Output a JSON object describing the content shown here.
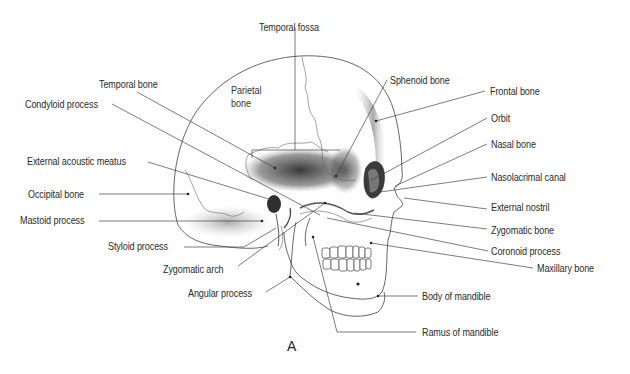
{
  "figure": {
    "caption": "A"
  },
  "inner_labels": {
    "parietal": "Parietal\nbone",
    "parietal_line1": "Parietal",
    "parietal_line2": "bone"
  },
  "labels_top": {
    "temporal_fossa": "Temporal fossa"
  },
  "labels_left": [
    {
      "id": "temporal-bone",
      "text": "Temporal bone"
    },
    {
      "id": "condyloid-process",
      "text": "Condyloid process"
    },
    {
      "id": "external-acoustic-meatus",
      "text": "External acoustic meatus"
    },
    {
      "id": "occipital-bone",
      "text": "Occipital bone"
    },
    {
      "id": "mastoid-process",
      "text": "Mastoid process"
    },
    {
      "id": "styloid-process",
      "text": "Styloid process"
    },
    {
      "id": "zygomatic-arch",
      "text": "Zygomatic arch"
    },
    {
      "id": "angular-process",
      "text": "Angular process"
    }
  ],
  "labels_right": [
    {
      "id": "sphenoid-bone",
      "text": "Sphenoid bone"
    },
    {
      "id": "frontal-bone",
      "text": "Frontal bone"
    },
    {
      "id": "orbit",
      "text": "Orbit"
    },
    {
      "id": "nasal-bone",
      "text": "Nasal bone"
    },
    {
      "id": "nasolacrimal-canal",
      "text": "Nasolacrimal canal"
    },
    {
      "id": "external-nostril",
      "text": "External nostril"
    },
    {
      "id": "zygomatic-bone",
      "text": "Zygomatic bone"
    },
    {
      "id": "coronoid-process",
      "text": "Coronoid process"
    },
    {
      "id": "maxillary-bone",
      "text": "Maxillary bone"
    },
    {
      "id": "body-of-mandible",
      "text": "Body of mandible"
    },
    {
      "id": "ramus-of-mandible",
      "text": "Ramus of mandible"
    }
  ],
  "colors": {
    "text": "#2a2a2a",
    "leader_line": "#444444",
    "bone_outline": "#555555",
    "shading_dark": "#3a3a3a",
    "background": "#ffffff"
  }
}
